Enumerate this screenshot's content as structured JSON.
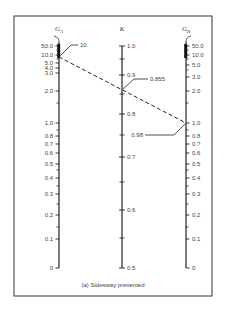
{
  "chart_data": {
    "type": "nomograph",
    "caption": "(a) Sidesway prevented",
    "axes": [
      {
        "name": "G_A",
        "title": "G",
        "subscript": "A",
        "x": 59,
        "top_symbol": "∞",
        "ticks": [
          {
            "label": "50.0",
            "value": 50.0,
            "y": 46
          },
          {
            "label": "10.0",
            "value": 10.0,
            "y": 55
          },
          {
            "label": "5.0",
            "value": 5.0,
            "y": 63
          },
          {
            "label": "4.0",
            "value": 4.0,
            "y": 68
          },
          {
            "label": "3.0",
            "value": 3.0,
            "y": 73
          },
          {
            "label": "2.0",
            "value": 2.0,
            "y": 91
          },
          {
            "label": "1.0",
            "value": 1.0,
            "y": 123
          },
          {
            "label": "0.8",
            "value": 0.8,
            "y": 136
          },
          {
            "label": "0.7",
            "value": 0.7,
            "y": 144
          },
          {
            "label": "0.6",
            "value": 0.6,
            "y": 153
          },
          {
            "label": "0.5",
            "value": 0.5,
            "y": 164
          },
          {
            "label": "0.4",
            "value": 0.4,
            "y": 178
          },
          {
            "label": "0.3",
            "value": 0.3,
            "y": 194
          },
          {
            "label": "0.2",
            "value": 0.2,
            "y": 215
          },
          {
            "label": "0.1",
            "value": 0.1,
            "y": 239
          },
          {
            "label": "0",
            "value": 0,
            "y": 268
          }
        ],
        "minor_ticks_y": [
          50,
          59,
          103,
          130,
          170,
          186,
          204,
          227
        ]
      },
      {
        "name": "K",
        "title": "K",
        "x": 122,
        "ticks": [
          {
            "label": "1.0",
            "value": 1.0,
            "y": 46
          },
          {
            "label": "0.9",
            "value": 0.9,
            "y": 75
          },
          {
            "label": "0.8",
            "value": 0.8,
            "y": 114
          },
          {
            "label": "0.7",
            "value": 0.7,
            "y": 157
          },
          {
            "label": "0.6",
            "value": 0.6,
            "y": 210
          },
          {
            "label": "0.5",
            "value": 0.5,
            "y": 268
          }
        ],
        "minor_ticks_y": [
          59,
          94,
          135,
          182,
          238
        ]
      },
      {
        "name": "G_B",
        "title": "G",
        "subscript": "B",
        "x": 186,
        "top_symbol": "∞",
        "ticks": [
          {
            "label": "50.0",
            "value": 50.0,
            "y": 46
          },
          {
            "label": "10.0",
            "value": 10.0,
            "y": 55
          },
          {
            "label": "5.0",
            "value": 5.0,
            "y": 65
          },
          {
            "label": "3.0",
            "value": 3.0,
            "y": 77
          },
          {
            "label": "2.0",
            "value": 2.0,
            "y": 91
          },
          {
            "label": "1.0",
            "value": 1.0,
            "y": 123
          },
          {
            "label": "0.8",
            "value": 0.8,
            "y": 136
          },
          {
            "label": "0.7",
            "value": 0.7,
            "y": 144
          },
          {
            "label": "0.6",
            "value": 0.6,
            "y": 153
          },
          {
            "label": "0.5",
            "value": 0.5,
            "y": 164
          },
          {
            "label": "0.4",
            "value": 0.4,
            "y": 178
          },
          {
            "label": "0.3",
            "value": 0.3,
            "y": 194
          },
          {
            "label": "0.2",
            "value": 0.2,
            "y": 215
          },
          {
            "label": "0.1",
            "value": 0.1,
            "y": 239
          },
          {
            "label": "0",
            "value": 0,
            "y": 268
          }
        ],
        "minor_ticks_y": [
          50,
          59,
          70,
          103,
          130,
          170,
          186,
          204,
          227
        ]
      }
    ],
    "solution_line": {
      "style": "dashed",
      "from": {
        "axis": "G_A",
        "value": 10,
        "x": 59,
        "y": 57
      },
      "to": {
        "axis": "G_B",
        "value": 0.98,
        "x": 186,
        "y": 123
      },
      "crosses": {
        "axis": "K",
        "value": 0.855,
        "x": 122,
        "y": 90
      }
    },
    "annotations": [
      {
        "text": "10",
        "target_axis": "G_A",
        "label_x": 80,
        "label_y": 47
      },
      {
        "text": "0.855",
        "target_axis": "K",
        "label_x": 150,
        "label_y": 81
      },
      {
        "text": "0.98",
        "target_axis": "G_B",
        "label_x": 143,
        "label_y": 137
      }
    ]
  },
  "frame": {
    "x": 14,
    "y": 16,
    "width": 198,
    "height": 280
  }
}
